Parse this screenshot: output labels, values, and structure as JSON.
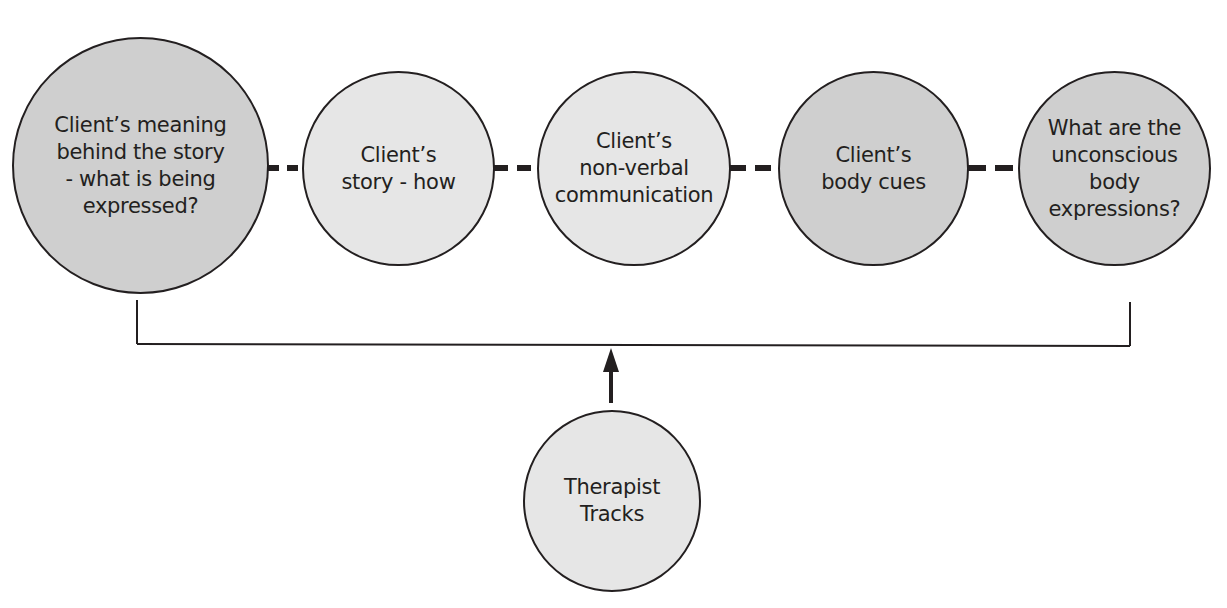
{
  "colors": {
    "stroke": "#231f20",
    "fill_dark": "#cfcfcf",
    "fill_light": "#e6e6e6",
    "background": "#ffffff"
  },
  "nodes": [
    {
      "id": "meaning",
      "label": "Client’s meaning\nbehind the story\n- what is being\nexpressed?",
      "shade": "dark"
    },
    {
      "id": "story",
      "label": "Client’s\nstory - how",
      "shade": "light"
    },
    {
      "id": "nonverbal",
      "label": "Client’s\nnon-verbal\ncommunication",
      "shade": "light"
    },
    {
      "id": "bodycues",
      "label": "Client’s\nbody cues",
      "shade": "dark"
    },
    {
      "id": "unconscious",
      "label": "What are the\nunconscious\nbody\nexpressions?",
      "shade": "dark"
    }
  ],
  "tracker": {
    "label": "Therapist\nTracks",
    "shade": "light"
  }
}
